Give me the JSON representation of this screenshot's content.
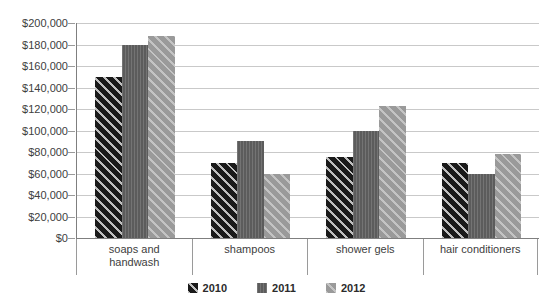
{
  "chart_data": {
    "type": "bar",
    "title": "",
    "xlabel": "",
    "ylabel": "",
    "categories": [
      "soaps and handwash",
      "shampoos",
      "shower gels",
      "hair conditioners"
    ],
    "series": [
      {
        "name": "2010",
        "color": "#1a1a1a",
        "pattern": "diagonal-hatch",
        "values": [
          150000,
          70000,
          75000,
          70000
        ]
      },
      {
        "name": "2011",
        "color": "#5c5c5c",
        "pattern": "vertical-lines",
        "values": [
          180000,
          90000,
          100000,
          60000
        ]
      },
      {
        "name": "2012",
        "color": "#9a9a9a",
        "pattern": "diagonal-hatch",
        "values": [
          188000,
          60000,
          123000,
          78000
        ]
      }
    ],
    "ylim": [
      0,
      200000
    ],
    "ytick_step": 20000,
    "ytick_labels": [
      "$0",
      "$20,000",
      "$40,000",
      "$60,000",
      "$80,000",
      "$100,000",
      "$120,000",
      "$140,000",
      "$160,000",
      "$180,000",
      "$200,000"
    ],
    "grid": true,
    "legend_position": "bottom",
    "legend_entries": [
      "2010",
      "2011",
      "2012"
    ]
  }
}
